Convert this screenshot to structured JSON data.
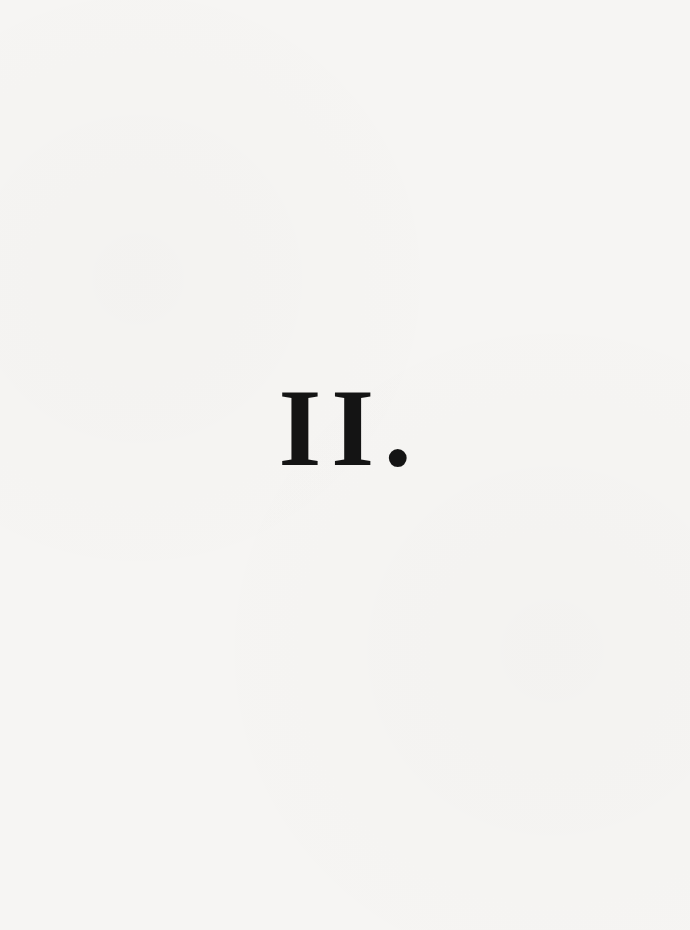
{
  "page": {
    "section_heading": "II."
  }
}
